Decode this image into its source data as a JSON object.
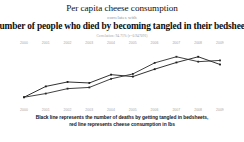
{
  "header": {
    "title_primary": "Per capita cheese consumption",
    "connector": "correlates with",
    "title_secondary": "Number of people who died by becoming tangled in their bedsheets",
    "correlation_note": "Correlation: 94.71% (r=0.947091)"
  },
  "caption": {
    "line1": "Black line represents the number of deaths by getting tangled in bedsheets,",
    "line2": "red line represents cheese consumption in lbs"
  },
  "colors": {
    "black_line": "#1a1a1a",
    "red_line": "#2b2b2b",
    "year_label": "#a4a4a4",
    "connector_text": "#8d8d8d",
    "background": "#ffffff"
  },
  "chart_data": {
    "type": "line",
    "title": "Per capita cheese consumption correlates with Number of people who died by becoming tangled in their bedsheets",
    "xlabel": "",
    "ylabel": "",
    "grid": false,
    "legend": "below-chart",
    "categories": [
      "2000",
      "2001",
      "2002",
      "2003",
      "2004",
      "2005",
      "2006",
      "2007",
      "2008",
      "2009"
    ],
    "series": [
      {
        "name": "Number of people who died by becoming tangled in their bedsheets",
        "color": "#1a1a1a",
        "unit": "deaths",
        "values": [
          327,
          456,
          509,
          497,
          596,
          573,
          661,
          741,
          809,
          717
        ]
      },
      {
        "name": "Per capita cheese consumption",
        "color": "#2b2b2b",
        "unit": "lbs",
        "values": [
          29.8,
          30.1,
          30.5,
          30.6,
          31.3,
          31.7,
          32.6,
          33.1,
          32.7,
          32.8
        ]
      }
    ],
    "markers": "square",
    "x_axis_labels_position": "top-and-bottom",
    "y_axis_labels": false
  }
}
